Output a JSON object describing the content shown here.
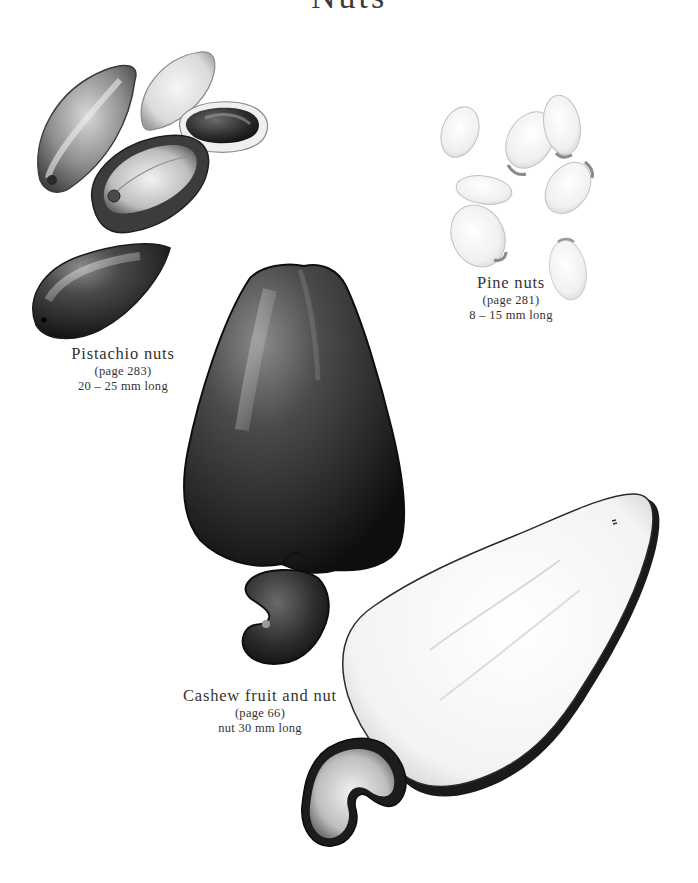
{
  "page": {
    "title": "Nuts",
    "background": "#ffffff"
  },
  "illustrations": [
    {
      "id": "pistachio",
      "caption": {
        "name": "Pistachio nuts",
        "page_ref": "(page 283)",
        "size": "20 – 25 mm long"
      }
    },
    {
      "id": "pine",
      "caption": {
        "name": "Pine nuts",
        "page_ref": "(page 281)",
        "size": "8 – 15 mm long"
      }
    },
    {
      "id": "cashew",
      "caption": {
        "name": "Cashew fruit and nut",
        "page_ref": "(page 66)",
        "size": "nut 30 mm long"
      }
    }
  ]
}
